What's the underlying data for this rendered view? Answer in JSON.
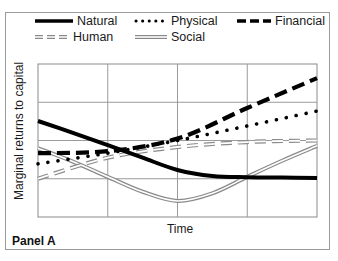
{
  "chart_data": {
    "type": "line",
    "title": "",
    "panel_label": "Panel A",
    "xlabel": "Time",
    "ylabel": "Marginal returns to capital",
    "xlim": [
      0,
      4
    ],
    "ylim": [
      0,
      4
    ],
    "grid": true,
    "legend_position": "top",
    "series": [
      {
        "name": "Natural",
        "style": "solid-thick",
        "color": "#000000",
        "points": [
          [
            0,
            2.51
          ],
          [
            0.5,
            2.2
          ],
          [
            1,
            1.88
          ],
          [
            1.5,
            1.55
          ],
          [
            2,
            1.23
          ],
          [
            2.5,
            1.07
          ],
          [
            3,
            1.04
          ],
          [
            3.5,
            1.03
          ],
          [
            4,
            1.02
          ]
        ]
      },
      {
        "name": "Physical",
        "style": "dotted",
        "color": "#000000",
        "points": [
          [
            0,
            1.39
          ],
          [
            1,
            1.67
          ],
          [
            2,
            2.0
          ],
          [
            3,
            2.38
          ],
          [
            4,
            2.77
          ]
        ]
      },
      {
        "name": "Financial",
        "style": "dashed-thick",
        "color": "#000000",
        "points": [
          [
            0,
            1.67
          ],
          [
            1,
            1.72
          ],
          [
            2,
            2.05
          ],
          [
            3,
            2.85
          ],
          [
            4,
            3.63
          ]
        ]
      },
      {
        "name": "Human",
        "style": "dashed-hollow",
        "color": "#888888",
        "points": [
          [
            0,
            1.0
          ],
          [
            1,
            1.55
          ],
          [
            2,
            1.83
          ],
          [
            3,
            1.96
          ],
          [
            4,
            2.0
          ]
        ]
      },
      {
        "name": "Social",
        "style": "double-line",
        "color": "#888888",
        "points": [
          [
            0,
            1.8
          ],
          [
            0.5,
            1.45
          ],
          [
            1,
            1.05
          ],
          [
            1.5,
            0.66
          ],
          [
            2,
            0.42
          ],
          [
            2.5,
            0.62
          ],
          [
            3,
            1.05
          ],
          [
            3.5,
            1.47
          ],
          [
            4,
            1.86
          ]
        ]
      }
    ]
  },
  "legend": [
    {
      "label": "Natural"
    },
    {
      "label": "Physical"
    },
    {
      "label": "Financial"
    },
    {
      "label": "Human"
    },
    {
      "label": "Social"
    }
  ]
}
